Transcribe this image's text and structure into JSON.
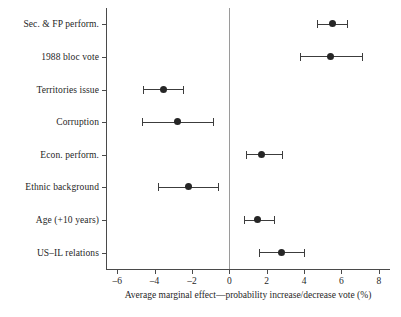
{
  "chart_data": {
    "type": "scatter",
    "title": "",
    "subtitle": "",
    "xlabel": "Average marginal effect—probability increase/decrease vote (%)",
    "ylabel": "",
    "orientation": "horizontal",
    "plot_style": "dot-and-whisker coefficient plot",
    "grid": false,
    "legend": "none",
    "reference_line": 0,
    "xlim": [
      -6.6,
      8.6
    ],
    "xticks": [
      -6,
      -4,
      -2,
      0,
      2,
      4,
      6,
      8
    ],
    "xtick_labels": [
      "–6",
      "–4",
      "–2",
      "0",
      "2",
      "4",
      "6",
      "8"
    ],
    "categories": [
      "Sec. & FP perform.",
      "1988 bloc vote",
      "Territories issue",
      "Corruption",
      "Econ. perform.",
      "Ethnic background",
      "Age (+10 years)",
      "US–IL relations"
    ],
    "values": [
      5.5,
      5.4,
      -3.5,
      -2.8,
      1.7,
      -2.2,
      1.5,
      2.8
    ],
    "ci_low": [
      4.7,
      3.8,
      -4.6,
      -4.7,
      0.9,
      -3.8,
      0.8,
      1.6
    ],
    "ci_high": [
      6.3,
      7.1,
      -2.5,
      -0.9,
      2.8,
      -0.6,
      2.4,
      4.0
    ],
    "error_bar_type": "confidence interval",
    "point_color": "#262626",
    "line_color": "#3c3c3c",
    "axis_color": "#4a4a4a",
    "reference_line_color": "#9a9a9a"
  }
}
